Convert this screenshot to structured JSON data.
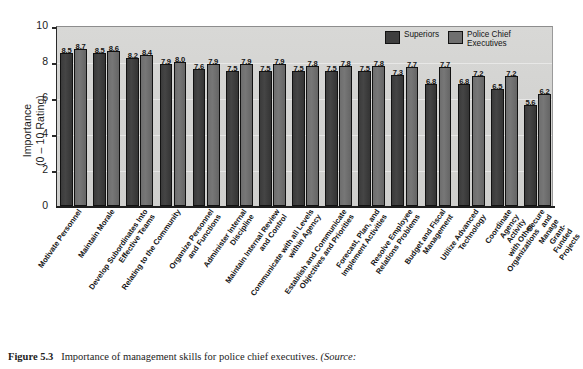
{
  "chart_data": {
    "type": "bar",
    "title": "",
    "xlabel": "",
    "ylabel": "Importance\n(0 – 10 Rating)",
    "ylim": [
      0,
      10
    ],
    "yticks": [
      0,
      2,
      4,
      6,
      8,
      10
    ],
    "grid": true,
    "legend_position": "top-right",
    "categories": [
      "Motivate Personnel",
      "Maintain Morale",
      "Develop Subordinates Into\nEffective Teams",
      "Relating to the Community",
      "Organize Personnel\nand Functions",
      "Administer Internal\nDiscipline",
      "Maintain Internal Review\nand Control",
      "Communicate with all Levels\nwithin Agency",
      "Establish and Communicate\nObjectives and Priorities",
      "Forecast, Plan, and\nImplement Activities",
      "Resolve Employee\nRelations Problems",
      "Budget and Fiscal\nManagement",
      "Utilize Advanced\nTechnology",
      "Coordinate Agency Activity\nwith Other Organizations",
      "Secure and Manage\nGrant-Funded Projects"
    ],
    "series": [
      {
        "name": "Superiors",
        "color": "#3f3f3f",
        "values": [
          8.5,
          8.5,
          8.2,
          7.9,
          7.6,
          7.5,
          7.5,
          7.5,
          7.5,
          7.5,
          7.3,
          6.8,
          6.8,
          6.5,
          5.6
        ]
      },
      {
        "name": "Police Chief\nExecutives",
        "color": "#6f6f6f",
        "values": [
          8.7,
          8.6,
          8.4,
          8.0,
          7.9,
          7.9,
          7.9,
          7.8,
          7.8,
          7.8,
          7.7,
          7.7,
          7.2,
          7.2,
          6.2
        ]
      }
    ]
  },
  "legend": {
    "items": [
      {
        "label": "Superiors",
        "color": "#3f3f3f"
      },
      {
        "label": "Police Chief\nExecutives",
        "color": "#6f6f6f"
      }
    ]
  },
  "caption": {
    "figure_label": "Figure 5.3",
    "text": "Importance of management skills for police chief executives.",
    "source_prefix": "(Source:"
  }
}
